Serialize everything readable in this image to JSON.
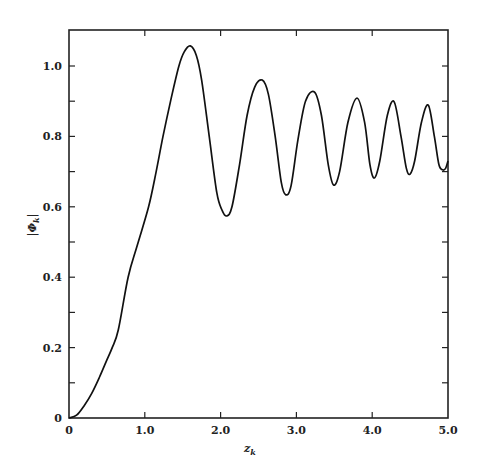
{
  "chart_data": {
    "type": "line",
    "title": "",
    "xlabel": "z_k",
    "ylabel": "|Φ_k|",
    "xlim": [
      0,
      5.0
    ],
    "ylim": [
      0,
      1.1
    ],
    "grid": false,
    "legend": null,
    "x_ticks": [
      0,
      1.0,
      2.0,
      3.0,
      4.0,
      5.0
    ],
    "x_tick_labels": [
      "0",
      "1.0",
      "2.0",
      "3.0",
      "4.0",
      "5.0"
    ],
    "x_minor_ticks": [],
    "y_ticks": [
      0,
      0.2,
      0.4,
      0.6,
      0.8,
      1.0
    ],
    "y_tick_labels": [
      "0",
      "0.2",
      "0.4",
      "0.6",
      "0.8",
      "1.0"
    ],
    "y_minor_ticks": [
      0.1,
      0.3,
      0.5,
      0.7,
      0.9
    ],
    "series": [
      {
        "name": "|Φ_k|",
        "color": "#111111",
        "x": [
          0,
          0.1,
          0.2,
          0.3,
          0.4,
          0.5,
          0.57,
          0.65,
          0.78,
          0.9,
          1.05,
          1.15,
          1.24,
          1.35,
          1.45,
          1.52,
          1.6,
          1.68,
          1.75,
          1.85,
          1.95,
          2.02,
          2.08,
          2.15,
          2.25,
          2.35,
          2.45,
          2.55,
          2.63,
          2.72,
          2.8,
          2.86,
          2.93,
          3.02,
          3.12,
          3.24,
          3.33,
          3.42,
          3.49,
          3.57,
          3.68,
          3.8,
          3.9,
          3.97,
          4.03,
          4.1,
          4.2,
          4.29,
          4.38,
          4.45,
          4.5,
          4.56,
          4.65,
          4.74,
          4.82,
          4.88,
          4.93,
          4.97,
          5.0
        ],
        "y": [
          0,
          0.008,
          0.035,
          0.07,
          0.115,
          0.165,
          0.2,
          0.25,
          0.4,
          0.49,
          0.6,
          0.7,
          0.8,
          0.91,
          1.0,
          1.04,
          1.057,
          1.03,
          0.96,
          0.8,
          0.64,
          0.59,
          0.574,
          0.6,
          0.72,
          0.86,
          0.94,
          0.96,
          0.92,
          0.8,
          0.67,
          0.634,
          0.66,
          0.79,
          0.9,
          0.926,
          0.86,
          0.72,
          0.662,
          0.7,
          0.84,
          0.909,
          0.84,
          0.72,
          0.682,
          0.73,
          0.86,
          0.898,
          0.8,
          0.71,
          0.693,
          0.73,
          0.84,
          0.889,
          0.8,
          0.72,
          0.705,
          0.71,
          0.73
        ]
      }
    ]
  }
}
